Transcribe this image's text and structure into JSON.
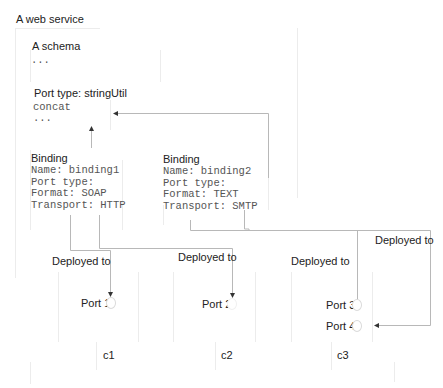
{
  "diagram": {
    "title": "A web service",
    "schema": {
      "label": "A schema",
      "content": "..."
    },
    "port_type": {
      "label": "Port type: stringUtil",
      "lines": [
        "concat",
        "..."
      ]
    },
    "bindings": [
      {
        "label": "Binding",
        "lines": [
          "Name: binding1",
          "Port type:",
          "Format: SOAP",
          "Transport: HTTP"
        ]
      },
      {
        "label": "Binding",
        "lines": [
          "Name: binding2",
          "Port type:",
          "Format: TEXT",
          "Transport: SMTP"
        ]
      }
    ],
    "deployments": [
      {
        "label": "Deployed to"
      },
      {
        "label": "Deployed to"
      },
      {
        "label": "Deployed to"
      },
      {
        "label": "Deployed to"
      }
    ],
    "ports": [
      {
        "label": "Port 1"
      },
      {
        "label": "Port 2"
      },
      {
        "label": "Port 3"
      },
      {
        "label": "Port 4"
      }
    ],
    "containers": [
      {
        "label": "c1"
      },
      {
        "label": "c2"
      },
      {
        "label": "c3"
      }
    ],
    "colors": {
      "line": "#b8b8b8",
      "faint_border": "#ececec",
      "text": "#222222",
      "code": "#555555"
    }
  }
}
